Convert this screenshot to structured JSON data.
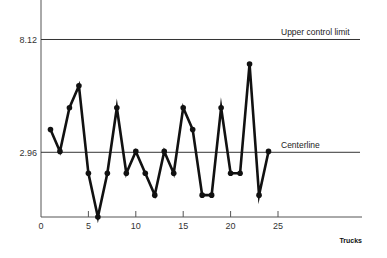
{
  "chart_data": {
    "type": "line",
    "title": "",
    "xlabel": "Trucks",
    "ylabel": "",
    "x": [
      1,
      2,
      3,
      4,
      5,
      6,
      7,
      8,
      9,
      10,
      11,
      12,
      13,
      14,
      15,
      16,
      17,
      18,
      19,
      20,
      21,
      22,
      23,
      24
    ],
    "series": [
      {
        "name": "Defects per truck",
        "values": [
          4,
          3,
          5,
          6,
          2,
          0,
          2,
          5,
          2,
          3,
          2,
          1,
          3,
          2,
          5,
          4,
          1,
          1,
          5,
          2,
          2,
          7,
          1,
          3
        ]
      }
    ],
    "xlim": [
      0,
      34
    ],
    "ylim": [
      0,
      9.9
    ],
    "xticks": [
      0,
      5,
      10,
      15,
      20,
      25
    ],
    "yticks": [
      {
        "value": 8.12,
        "label": "8.12"
      },
      {
        "value": 2.96,
        "label": "2.96"
      }
    ],
    "reference_lines": [
      {
        "name": "Upper control limit",
        "value": 8.12,
        "label": "Upper control limit"
      },
      {
        "name": "Centerline",
        "value": 2.96,
        "label": "Centerline"
      }
    ],
    "grid": false,
    "legend": "none",
    "markers": true
  },
  "colors": {
    "series": "#111111",
    "axis": "#555555",
    "reference": "#333333",
    "text": "#222222"
  }
}
